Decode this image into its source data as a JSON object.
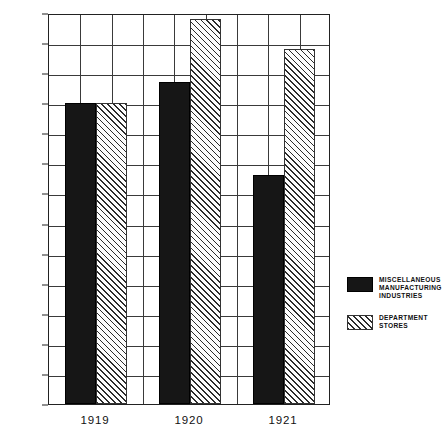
{
  "chart_data": {
    "type": "bar",
    "title": "",
    "subtitle": "",
    "xlabel": "",
    "ylabel": "1919 AVERAGE 100",
    "categories": [
      "1919",
      "1920",
      "1921"
    ],
    "series": [
      {
        "name": "MISCELLANEOUS MANUFACTURING INDUSTRIES",
        "name_lines": [
          "MISCELLANEOUS",
          "MANUFACTURING",
          "INDUSTRIES"
        ],
        "fill": "solid-black",
        "color": "#161616",
        "values": [
          100,
          107,
          76
        ]
      },
      {
        "name": "DEPARTMENT STORES",
        "name_lines": [
          "DEPARTMENT",
          "STORES"
        ],
        "fill": "diagonal-hatch",
        "color": "#2b2b2b",
        "values": [
          100,
          128,
          118
        ]
      }
    ],
    "ylim": [
      0,
      130
    ],
    "ytick_values": [
      0,
      10,
      20,
      30,
      40,
      50,
      60,
      70,
      80,
      90,
      100,
      110,
      120,
      130
    ],
    "ytick_labels": [
      "0",
      "10",
      "20",
      "30",
      "40",
      "50",
      "60",
      "70",
      "80",
      "90",
      "100",
      "11 0",
      "120",
      "130"
    ],
    "grid": true,
    "grid_horizontal": true,
    "grid_vertical": true,
    "vertical_gridline_count": 9,
    "legend_position": "right"
  },
  "legend": {
    "entries": [
      {
        "label": "MISCELLANEOUS MANUFACTURING INDUSTRIES",
        "line1": "MISCELLANEOUS",
        "line2": "MANUFACTURING",
        "line3": "INDUSTRIES"
      },
      {
        "label": "DEPARTMENT STORES",
        "line1": "DEPARTMENT",
        "line2": "STORES",
        "line3": ""
      }
    ]
  }
}
